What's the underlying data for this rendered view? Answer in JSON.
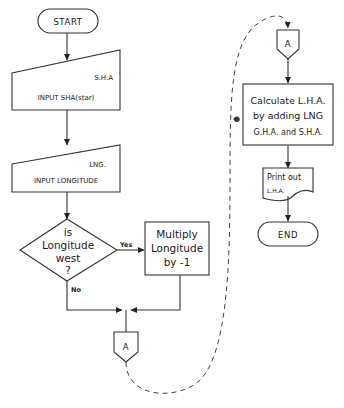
{
  "diagram": {
    "type": "flowchart",
    "colors": {
      "stroke": "#333333",
      "text": "#1a1a1a",
      "background": "#ffffff"
    },
    "nodes": {
      "start": {
        "shape": "terminal",
        "label": "START"
      },
      "input_sha": {
        "shape": "manual-input",
        "tag": "S.H.A",
        "label": "INPUT SHA(star)"
      },
      "input_lng": {
        "shape": "manual-input",
        "tag": "LNG.",
        "label": "INPUT LONGITUDE"
      },
      "decision": {
        "shape": "decision",
        "lines": [
          "is",
          "Longitude",
          "west",
          "?"
        ]
      },
      "multiply": {
        "shape": "process",
        "lines": [
          "Multiply",
          "Longitude",
          "by  -1"
        ]
      },
      "connector_out": {
        "shape": "off-page-connector",
        "label": "A"
      },
      "connector_in": {
        "shape": "off-page-connector",
        "label": "A"
      },
      "calculate": {
        "shape": "process",
        "lines": [
          "Calculate L.H.A.",
          "by adding LNG",
          "G.H.A. and S.H.A."
        ]
      },
      "print": {
        "shape": "document",
        "lines": [
          "Print out",
          "L.H.A."
        ]
      },
      "end": {
        "shape": "terminal",
        "label": "END"
      }
    },
    "edge_labels": {
      "yes": "Yes",
      "no": "No"
    },
    "edges": [
      [
        "start",
        "input_sha"
      ],
      [
        "input_sha",
        "input_lng"
      ],
      [
        "input_lng",
        "decision"
      ],
      [
        "decision",
        "multiply",
        "Yes"
      ],
      [
        "decision",
        "connector_out",
        "No"
      ],
      [
        "multiply",
        "connector_out"
      ],
      [
        "connector_out",
        "connector_in",
        "dashed"
      ],
      [
        "connector_in",
        "calculate"
      ],
      [
        "calculate",
        "print"
      ],
      [
        "print",
        "end"
      ]
    ]
  }
}
